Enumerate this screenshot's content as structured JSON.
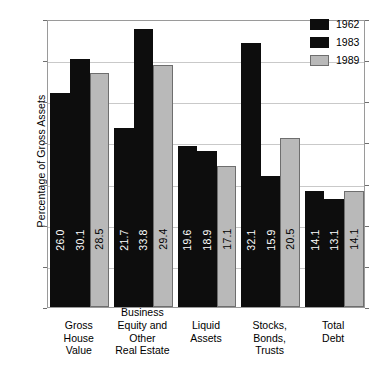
{
  "chart_data": {
    "type": "bar",
    "title": "",
    "xlabel": "",
    "ylabel": "Percentage of Gross Assets",
    "ylim": [
      0,
      35
    ],
    "yticks": [
      0,
      5,
      10,
      15,
      20,
      25,
      30,
      35
    ],
    "grid": true,
    "legend_position": "top-right",
    "categories": [
      "Gross\nHouse\nValue",
      "Business\nEquity and\nOther\nReal Estate",
      "Liquid\nAssets",
      "Stocks,\nBonds,\nTrusts",
      "Total\nDebt"
    ],
    "series": [
      {
        "name": "1962",
        "color": "#0d0d0d",
        "values": [
          26.0,
          21.7,
          19.6,
          32.1,
          14.1
        ]
      },
      {
        "name": "1983",
        "color": "#0d0d0d",
        "values": [
          30.1,
          33.8,
          18.9,
          15.9,
          13.1
        ]
      },
      {
        "name": "1989",
        "color": "#b9b9b9",
        "values": [
          28.5,
          29.4,
          17.1,
          20.5,
          14.1
        ]
      }
    ],
    "value_labels": [
      [
        "26.0",
        "30.1",
        "28.5"
      ],
      [
        "21.7",
        "33.8",
        "29.4"
      ],
      [
        "19.6",
        "18.9",
        "17.1"
      ],
      [
        "32.1",
        "15.9",
        "20.5"
      ],
      [
        "14.1",
        "13.1",
        "14.1"
      ]
    ],
    "tick_labels": [
      "0",
      "5",
      "10",
      "15",
      "20",
      "25",
      "30",
      "35"
    ],
    "legend_entries": [
      "1962",
      "1983",
      "1989"
    ]
  }
}
